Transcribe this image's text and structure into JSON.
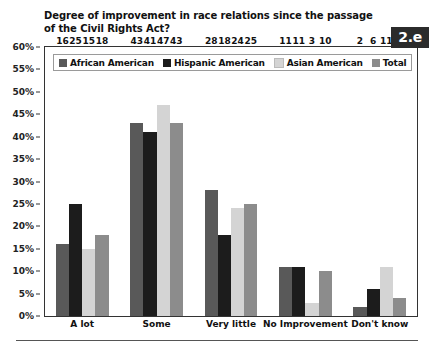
{
  "title": "Degree of improvement in race relations since the passage of the Civil Rights Act?",
  "badge": "2.e",
  "colors": {
    "african_american": "#595959",
    "hispanic_american": "#1c1c1c",
    "asian_american": "#d4d4d4",
    "total": "#8c8c8c",
    "axis": "#333333",
    "text": "#111111",
    "badge_bg": "#2b2b2b",
    "badge_text": "#ffffff"
  },
  "legend": {
    "items": [
      {
        "label": "African American",
        "color": "#595959",
        "swatch": "legend-swatch-african-american"
      },
      {
        "label": "Hispanic American",
        "color": "#1c1c1c",
        "swatch": "legend-swatch-hispanic-american"
      },
      {
        "label": "Asian American",
        "color": "#d4d4d4",
        "swatch": "legend-swatch-asian-american"
      },
      {
        "label": "Total",
        "color": "#8c8c8c",
        "swatch": "legend-swatch-total"
      }
    ]
  },
  "yaxis": {
    "ticks": [
      "0%",
      "5%",
      "10%",
      "15%",
      "20%",
      "25%",
      "30%",
      "35%",
      "40%",
      "45%",
      "50%",
      "55%",
      "60%"
    ],
    "tick_values": [
      0,
      5,
      10,
      15,
      20,
      25,
      30,
      35,
      40,
      45,
      50,
      55,
      60
    ]
  },
  "chart_data": {
    "type": "bar",
    "title": "Degree of improvement in race relations since the passage of the Civil Rights Act?",
    "xlabel": "",
    "ylabel": "",
    "ylim": [
      0,
      60
    ],
    "ytick_step": 5,
    "ytick_format": "percent",
    "grid": false,
    "legend_position": "top-left",
    "categories": [
      "A lot",
      "Some",
      "Very little",
      "No Improvement",
      "Don't know"
    ],
    "series": [
      {
        "name": "African American",
        "color": "#595959",
        "values": [
          16,
          43,
          28,
          11,
          2
        ]
      },
      {
        "name": "Hispanic American",
        "color": "#1c1c1c",
        "values": [
          25,
          41,
          18,
          11,
          6
        ]
      },
      {
        "name": "Asian American",
        "color": "#d4d4d4",
        "values": [
          15,
          47,
          24,
          3,
          11
        ]
      },
      {
        "name": "Total",
        "color": "#8c8c8c",
        "values": [
          18,
          43,
          25,
          10,
          4
        ]
      }
    ]
  }
}
